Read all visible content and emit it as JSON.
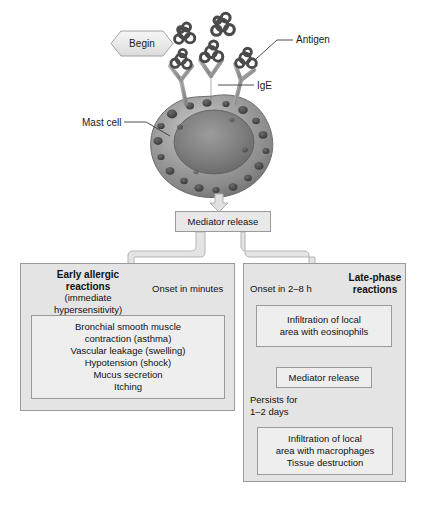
{
  "figure": {
    "begin_label": "Begin",
    "callouts": {
      "antigen": "Antigen",
      "ige": "IgE",
      "mast_cell": "Mast cell"
    },
    "mediator_release_top": "Mediator release",
    "early_branch": {
      "header_bold_line1": "Early allergic",
      "header_bold_line2": "reactions",
      "header_sub_line1": "(immediate",
      "header_sub_line2": "hypersensitivity)",
      "onset": "Onset in minutes",
      "symptoms": [
        "Bronchial smooth muscle",
        "contraction (asthma)",
        "Vascular leakage (swelling)",
        "Hypotension (shock)",
        "Mucus secretion",
        "Itching"
      ]
    },
    "late_branch": {
      "header_line1": "Late-phase",
      "header_line2": "reactions",
      "onset": "Onset in 2–8 h",
      "eosinophils": [
        "Infiltration of local",
        "area with eosinophils"
      ],
      "mediator_release": "Mediator release",
      "persists_line1": "Persists for",
      "persists_line2": "1–2 days",
      "macrophages": [
        "Infiltration of local",
        "area with macrophages",
        "Tissue destruction"
      ]
    },
    "colors": {
      "panel_fill": "#e4e4e4",
      "box_fill": "#e8e8e8",
      "border": "#9a9a9a",
      "arrow": "#cfcfcf",
      "text": "#111111",
      "cell_body": "#8f8f8f",
      "cell_nucleus": "#6e6e6e",
      "granule": "#4a4a4a",
      "antibody": "#9b9b9b",
      "antigen": "#4f4f4f"
    }
  }
}
